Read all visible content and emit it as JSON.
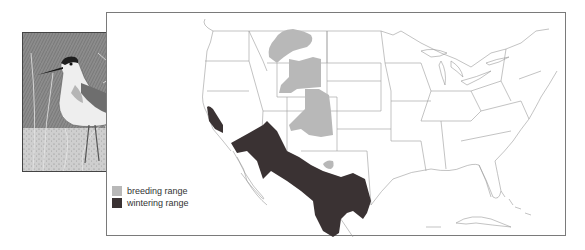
{
  "figure": {
    "type": "species range map",
    "region": "United States and northern Mexico",
    "photo": {
      "subject": "shorebird illustration (phalarope-like) among grasses",
      "style": "grayscale stipple drawing"
    }
  },
  "legend": {
    "items": [
      {
        "label": "breeding range",
        "color": "#b8b8b8"
      },
      {
        "label": "wintering range",
        "color": "#3a3233"
      }
    ]
  },
  "colors": {
    "breeding": "#b8b8b8",
    "wintering": "#3a3233",
    "borders": "#9a9a9a",
    "frame": "#7a7a7a"
  }
}
